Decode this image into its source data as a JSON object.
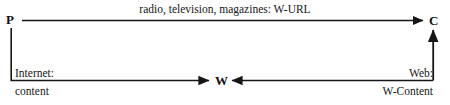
{
  "figure": {
    "type": "directed-graph-diagram",
    "background_color": "#ffffff",
    "stroke_color": "#161616"
  },
  "nodes": [
    {
      "id": "P",
      "label": "P",
      "x": 10,
      "y": 20,
      "role": "producer"
    },
    {
      "id": "C",
      "label": "C",
      "x": 434,
      "y": 20,
      "role": "consumer"
    },
    {
      "id": "W",
      "label": "W",
      "x": 220,
      "y": 81,
      "role": "web"
    }
  ],
  "edges": [
    {
      "id": "p-to-c",
      "from": "P",
      "to": "C",
      "direction": "right",
      "label": "radio, television, magazines: W-URL",
      "label_align": "center"
    },
    {
      "id": "p-to-w",
      "from": "P",
      "to": "W",
      "direction": "down-right",
      "label_line1": "Internet:",
      "label_line2": "content",
      "label_align": "left"
    },
    {
      "id": "w-to-c",
      "from": "W",
      "to": "C",
      "direction": "right-up",
      "label_line1": "Web:",
      "label_line2": "W-Content",
      "label_align": "right"
    }
  ]
}
